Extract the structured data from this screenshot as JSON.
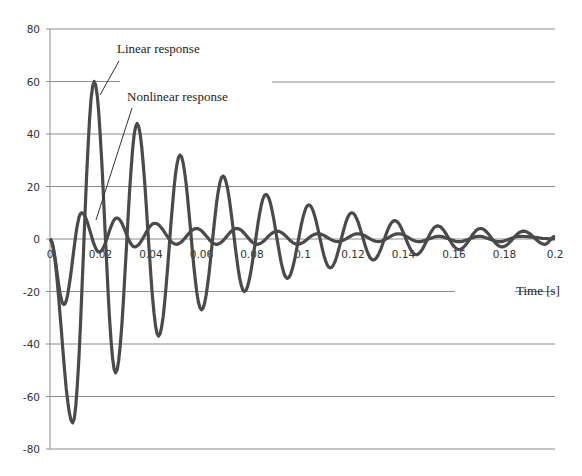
{
  "chart_data": {
    "type": "line",
    "title": "",
    "xlabel": "Time [s]",
    "ylabel": "",
    "xlim": [
      0,
      0.2
    ],
    "ylim": [
      -80,
      80
    ],
    "grid": {
      "horizontal": true,
      "vertical": false
    },
    "legend": "none (inline annotations)",
    "x_ticks": [
      "0",
      "0.02",
      "0.04",
      "0.06",
      "0.08",
      "0.1",
      "0.12",
      "0.14",
      "0.16",
      "0.18",
      "0.2"
    ],
    "y_ticks": [
      "80",
      "60",
      "40",
      "20",
      "0",
      "-20",
      "-40",
      "-60",
      "-80"
    ],
    "annotations": [
      "Linear response",
      "Nonlinear response"
    ],
    "series": [
      {
        "name": "Linear response",
        "x": [
          0,
          0.009,
          0.0175,
          0.026,
          0.0345,
          0.043,
          0.0515,
          0.06,
          0.0685,
          0.077,
          0.0855,
          0.094,
          0.1025,
          0.111,
          0.1195,
          0.128,
          0.1365,
          0.145,
          0.1535,
          0.162,
          0.1705,
          0.179,
          0.1875,
          0.196,
          0.2
        ],
        "values": [
          0,
          -70,
          60,
          -51,
          44,
          -37,
          32,
          -27,
          24,
          -20,
          17,
          -15,
          13,
          -11,
          10,
          -8,
          7,
          -6,
          5,
          -4,
          4,
          -3,
          3,
          -2,
          1
        ]
      },
      {
        "name": "Nonlinear response",
        "x": [
          0,
          0.0055,
          0.0125,
          0.0195,
          0.0265,
          0.0335,
          0.0415,
          0.05,
          0.058,
          0.066,
          0.074,
          0.082,
          0.09,
          0.098,
          0.106,
          0.114,
          0.122,
          0.13,
          0.138,
          0.146,
          0.154,
          0.162,
          0.17,
          0.178,
          0.186,
          0.2
        ],
        "values": [
          0,
          -25,
          10,
          -5,
          8,
          -3,
          6,
          -2,
          4,
          -2,
          4,
          -2,
          3,
          -2,
          2,
          -1,
          2,
          -1,
          2,
          -1,
          1,
          -1,
          1,
          -1,
          1,
          0
        ]
      }
    ]
  },
  "labels": {
    "x_axis_title": "Time [s]",
    "annotation_linear": "Linear response",
    "annotation_nonlinear": "Nonlinear response"
  },
  "style": {
    "line_color": "#4a4a4a",
    "grid_color": "#8c8c8c",
    "text_color": "#333333"
  }
}
